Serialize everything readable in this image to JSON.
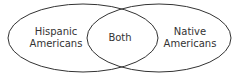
{
  "diagram": {
    "type": "venn",
    "left_set": {
      "line1": "Hispanic",
      "line2": "Americans"
    },
    "intersection": {
      "label": "Both"
    },
    "right_set": {
      "line1": "Native",
      "line2": "Americans"
    },
    "stroke_color": "#333333"
  }
}
